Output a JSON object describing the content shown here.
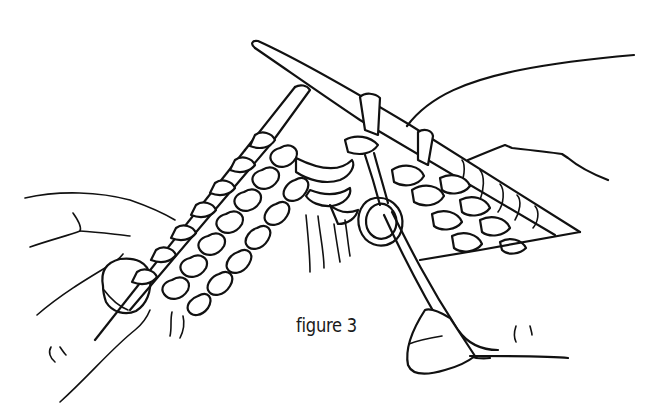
{
  "figure": {
    "caption": "figure 3",
    "colors": {
      "ink": "#111111",
      "background": "#ffffff"
    },
    "elements": [
      "left-hand",
      "left-needle",
      "right-needle",
      "right-hand",
      "knitted-fabric",
      "yarn-loop",
      "working-yarn"
    ]
  }
}
